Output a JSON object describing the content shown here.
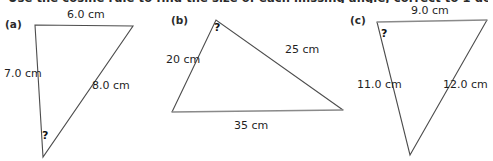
{
  "heading": {
    "text": "Use the cosine rule to find the size of each missing angle, correct to 1 decimal place."
  },
  "figures": [
    {
      "part_label": "(a)",
      "unknown_marker": "?",
      "sides": [
        {
          "name": "top-side",
          "label": "6.0 cm"
        },
        {
          "name": "left-side",
          "label": "7.0 cm"
        },
        {
          "name": "right-side",
          "label": "8.0 cm"
        }
      ]
    },
    {
      "part_label": "(b)",
      "unknown_marker": "?",
      "sides": [
        {
          "name": "left-side",
          "label": "20 cm"
        },
        {
          "name": "right-side",
          "label": "25 cm"
        },
        {
          "name": "bottom-side",
          "label": "35 cm"
        }
      ]
    },
    {
      "part_label": "(c)",
      "unknown_marker": "?",
      "sides": [
        {
          "name": "top-side",
          "label": "9.0 cm"
        },
        {
          "name": "left-side",
          "label": "11.0 cm"
        },
        {
          "name": "right-side",
          "label": "12.0 cm"
        }
      ]
    }
  ],
  "colors": {
    "stroke_dark": "#4d4d4d",
    "stroke_light": "#8a8a8a",
    "text": "#1f1f1f",
    "background": "#ffffff"
  }
}
